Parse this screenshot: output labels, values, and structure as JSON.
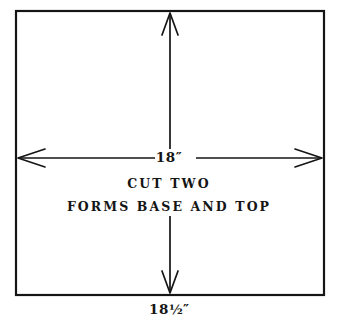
{
  "diagram": {
    "background_color": "#ffffff",
    "line_color": "#151515",
    "panel": {
      "name": "rectangular-panel",
      "border_width_px": 2
    },
    "dimensions": {
      "width": {
        "label": "18″",
        "value": 18,
        "unit": "inch",
        "orientation": "horizontal",
        "arrow_style": "open-v-both-ends"
      },
      "height": {
        "label": "18½″",
        "value_whole": "18",
        "value_fraction": "½",
        "value_prime": "″",
        "value": 18.5,
        "unit": "inch",
        "orientation": "vertical",
        "arrow_style": "open-v-both-ends"
      }
    },
    "notes": [
      {
        "text": "CUT TWO"
      },
      {
        "text": "FORMS BASE AND TOP"
      }
    ]
  }
}
